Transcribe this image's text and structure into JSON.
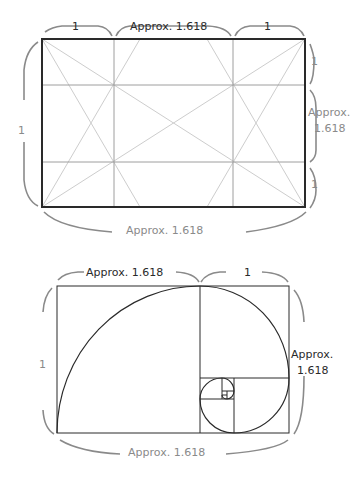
{
  "figure": {
    "top_diagram": {
      "title": "Golden ratio rectangle with phi grid",
      "labels": {
        "top_left": "1",
        "top_middle": "Approx. 1.618",
        "top_right": "1",
        "left": "1",
        "right_top": "1",
        "right_middle_line1": "Approx.",
        "right_middle_line2": "1.618",
        "right_bottom": "1",
        "bottom": "Approx. 1.618"
      }
    },
    "bottom_diagram": {
      "title": "Golden spiral",
      "labels": {
        "top_left": "Approx. 1.618",
        "top_right": "1",
        "left": "1",
        "right_line1": "Approx.",
        "right_line2": "1.618",
        "bottom": "Approx. 1.618"
      }
    },
    "colors": {
      "frame": "#2a2a2a",
      "grid": "#9a9a9a",
      "diagonal": "#c8c8c8",
      "brace": "#8a8a8a"
    }
  }
}
